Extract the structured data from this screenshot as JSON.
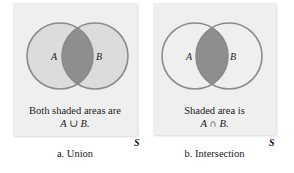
{
  "colors": {
    "box_background": "#efefef",
    "light_shade": "#dcdcdc",
    "dark_shade": "#8e8e8e",
    "circle_stroke": "#8a8a8a"
  },
  "panels": [
    {
      "id": "union",
      "set_a": "A",
      "set_b": "B",
      "caption_line1": "Both shaded areas are",
      "caption_line2": "A ∪ B.",
      "universe_label": "S",
      "panel_label": "a. Union"
    },
    {
      "id": "intersection",
      "set_a": "A",
      "set_b": "B",
      "caption_line1": "Shaded area is",
      "caption_line2": "A ∩ B.",
      "universe_label": "S",
      "panel_label": "b. Intersection"
    }
  ]
}
